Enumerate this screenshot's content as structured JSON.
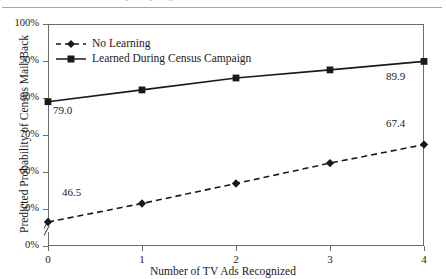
{
  "header": {
    "clipped_text": "attitudes toward participating in the census"
  },
  "chart_data": {
    "type": "line",
    "title": "",
    "xlabel": "Number of TV Ads Recognized",
    "ylabel": "Predicted Probability of Census Mail-Back",
    "x": [
      0,
      1,
      2,
      3,
      4
    ],
    "xtick_labels": [
      "0",
      "1",
      "2",
      "3",
      "4"
    ],
    "ytick_labels": [
      "100%",
      "90%",
      "80%",
      "70%",
      "60%",
      "50%",
      "0%"
    ],
    "ytick_values": [
      100,
      90,
      80,
      70,
      60,
      50,
      0
    ],
    "ylim": [
      45,
      100
    ],
    "axis_break": true,
    "grid": false,
    "legend_position": "upper left",
    "series": [
      {
        "name": "No Learning",
        "marker": "diamond",
        "line_style": "dashed",
        "color": "#1a1a1a",
        "values": [
          46.5,
          51.5,
          56.9,
          62.4,
          67.4
        ],
        "point_labels": {
          "0": "46.5",
          "4": "67.4"
        }
      },
      {
        "name": "Learned During Census Campaign",
        "marker": "square",
        "line_style": "solid",
        "color": "#1a1a1a",
        "values": [
          79.0,
          82.2,
          85.4,
          87.6,
          89.9
        ],
        "point_labels": {
          "0": "79.0",
          "4": "89.9"
        }
      }
    ],
    "annotations": [
      {
        "text": "79.0",
        "series": "Learned During Census Campaign",
        "x": 0
      },
      {
        "text": "89.9",
        "series": "Learned During Census Campaign",
        "x": 4
      },
      {
        "text": "46.5",
        "series": "No Learning",
        "x": 0
      },
      {
        "text": "67.4",
        "series": "No Learning",
        "x": 4
      }
    ]
  }
}
